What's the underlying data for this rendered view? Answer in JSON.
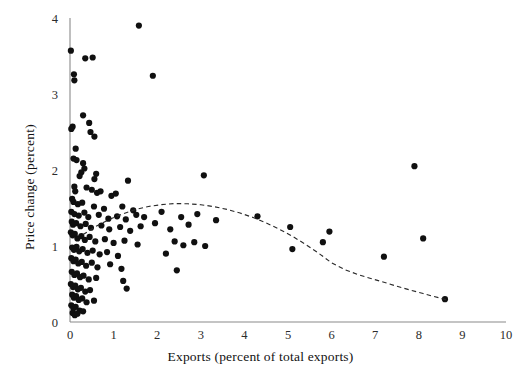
{
  "chart_data": {
    "type": "scatter",
    "title": "",
    "xlabel": "Exports (percent of total exports)",
    "ylabel": "Price change (percent)",
    "xlim": [
      0,
      10
    ],
    "ylim": [
      0,
      4
    ],
    "xticks": [
      0,
      1,
      2,
      3,
      4,
      5,
      6,
      7,
      8,
      9,
      10
    ],
    "yticks": [
      0,
      1,
      2,
      3,
      4
    ],
    "xtick_labels": [
      "0",
      "1",
      "2",
      "3",
      "4",
      "5",
      "6",
      "7",
      "8",
      "9",
      "10"
    ],
    "ytick_labels": [
      "0",
      "1",
      "2",
      "3",
      "4"
    ],
    "grid": false,
    "legend": false,
    "marker_color": "#101010",
    "marker_size": 3.1,
    "series": [
      {
        "name": "observations",
        "points": [
          [
            0.02,
            3.57
          ],
          [
            0.35,
            3.47
          ],
          [
            0.52,
            3.48
          ],
          [
            1.58,
            3.9
          ],
          [
            0.09,
            3.26
          ],
          [
            0.1,
            3.18
          ],
          [
            1.9,
            3.24
          ],
          [
            0.3,
            2.72
          ],
          [
            0.06,
            2.57
          ],
          [
            0.03,
            2.54
          ],
          [
            0.44,
            2.62
          ],
          [
            0.47,
            2.5
          ],
          [
            0.56,
            2.44
          ],
          [
            0.13,
            2.28
          ],
          [
            0.08,
            2.15
          ],
          [
            0.15,
            2.13
          ],
          [
            0.3,
            2.09
          ],
          [
            0.33,
            2.02
          ],
          [
            0.26,
            1.97
          ],
          [
            0.22,
            1.92
          ],
          [
            0.6,
            1.95
          ],
          [
            0.56,
            1.88
          ],
          [
            1.33,
            1.86
          ],
          [
            3.07,
            1.93
          ],
          [
            7.9,
            2.05
          ],
          [
            0.1,
            1.78
          ],
          [
            0.12,
            1.72
          ],
          [
            0.38,
            1.77
          ],
          [
            0.5,
            1.74
          ],
          [
            0.62,
            1.7
          ],
          [
            0.7,
            1.72
          ],
          [
            0.95,
            1.66
          ],
          [
            1.05,
            1.69
          ],
          [
            0.05,
            1.62
          ],
          [
            0.08,
            1.58
          ],
          [
            0.18,
            1.55
          ],
          [
            0.28,
            1.57
          ],
          [
            0.55,
            1.52
          ],
          [
            0.78,
            1.49
          ],
          [
            1.2,
            1.52
          ],
          [
            1.45,
            1.47
          ],
          [
            0.03,
            1.45
          ],
          [
            0.1,
            1.42
          ],
          [
            0.2,
            1.4
          ],
          [
            0.33,
            1.44
          ],
          [
            0.42,
            1.38
          ],
          [
            0.66,
            1.41
          ],
          [
            0.88,
            1.36
          ],
          [
            1.08,
            1.39
          ],
          [
            1.28,
            1.35
          ],
          [
            1.52,
            1.41
          ],
          [
            1.7,
            1.38
          ],
          [
            2.1,
            1.45
          ],
          [
            2.55,
            1.38
          ],
          [
            2.92,
            1.42
          ],
          [
            3.35,
            1.34
          ],
          [
            4.3,
            1.39
          ],
          [
            0.04,
            1.32
          ],
          [
            0.07,
            1.28
          ],
          [
            0.14,
            1.3
          ],
          [
            0.24,
            1.26
          ],
          [
            0.36,
            1.29
          ],
          [
            0.48,
            1.24
          ],
          [
            0.72,
            1.27
          ],
          [
            0.9,
            1.22
          ],
          [
            1.15,
            1.25
          ],
          [
            1.38,
            1.2
          ],
          [
            1.62,
            1.26
          ],
          [
            1.95,
            1.3
          ],
          [
            2.3,
            1.22
          ],
          [
            2.72,
            1.28
          ],
          [
            5.05,
            1.25
          ],
          [
            5.95,
            1.19
          ],
          [
            8.1,
            1.1
          ],
          [
            0.02,
            1.18
          ],
          [
            0.06,
            1.14
          ],
          [
            0.11,
            1.16
          ],
          [
            0.17,
            1.1
          ],
          [
            0.26,
            1.13
          ],
          [
            0.34,
            1.08
          ],
          [
            0.45,
            1.12
          ],
          [
            0.58,
            1.06
          ],
          [
            0.8,
            1.09
          ],
          [
            1.0,
            1.04
          ],
          [
            1.25,
            1.07
          ],
          [
            1.55,
            1.02
          ],
          [
            2.4,
            1.06
          ],
          [
            2.6,
            1.01
          ],
          [
            2.85,
            1.05
          ],
          [
            3.1,
            1.0
          ],
          [
            5.1,
            0.96
          ],
          [
            5.8,
            1.05
          ],
          [
            0.05,
            0.98
          ],
          [
            0.09,
            0.95
          ],
          [
            0.15,
            0.99
          ],
          [
            0.21,
            0.93
          ],
          [
            0.29,
            0.96
          ],
          [
            0.4,
            0.91
          ],
          [
            0.52,
            0.94
          ],
          [
            0.68,
            0.89
          ],
          [
            0.85,
            0.92
          ],
          [
            1.1,
            0.87
          ],
          [
            2.2,
            0.9
          ],
          [
            7.2,
            0.86
          ],
          [
            0.03,
            0.84
          ],
          [
            0.08,
            0.8
          ],
          [
            0.13,
            0.82
          ],
          [
            0.19,
            0.77
          ],
          [
            0.27,
            0.79
          ],
          [
            0.37,
            0.74
          ],
          [
            0.5,
            0.78
          ],
          [
            0.63,
            0.72
          ],
          [
            0.92,
            0.76
          ],
          [
            1.18,
            0.7
          ],
          [
            2.45,
            0.68
          ],
          [
            0.04,
            0.66
          ],
          [
            0.1,
            0.62
          ],
          [
            0.16,
            0.64
          ],
          [
            0.23,
            0.59
          ],
          [
            0.31,
            0.61
          ],
          [
            0.43,
            0.56
          ],
          [
            0.6,
            0.58
          ],
          [
            1.22,
            0.54
          ],
          [
            0.02,
            0.5
          ],
          [
            0.07,
            0.46
          ],
          [
            0.12,
            0.48
          ],
          [
            0.18,
            0.43
          ],
          [
            0.25,
            0.45
          ],
          [
            0.35,
            0.4
          ],
          [
            0.46,
            0.42
          ],
          [
            1.3,
            0.44
          ],
          [
            0.05,
            0.36
          ],
          [
            0.09,
            0.32
          ],
          [
            0.14,
            0.34
          ],
          [
            0.2,
            0.29
          ],
          [
            0.28,
            0.31
          ],
          [
            0.38,
            0.26
          ],
          [
            0.55,
            0.28
          ],
          [
            0.03,
            0.22
          ],
          [
            0.08,
            0.18
          ],
          [
            0.13,
            0.2
          ],
          [
            0.22,
            0.15
          ],
          [
            0.06,
            0.12
          ],
          [
            0.11,
            0.09
          ],
          [
            0.17,
            0.11
          ],
          [
            0.3,
            0.14
          ],
          [
            8.6,
            0.3
          ]
        ]
      }
    ],
    "fit_curve": {
      "name": "quadratic fit",
      "style": "dashed",
      "color": "#2a2a2a",
      "x_start": 0.3,
      "x_end": 8.62,
      "vertex_x": 2.55,
      "vertex_y": 1.56,
      "points": [
        [
          0.3,
          1.15
        ],
        [
          0.6,
          1.26
        ],
        [
          0.9,
          1.35
        ],
        [
          1.2,
          1.42
        ],
        [
          1.5,
          1.48
        ],
        [
          1.8,
          1.52
        ],
        [
          2.1,
          1.545
        ],
        [
          2.4,
          1.558
        ],
        [
          2.7,
          1.556
        ],
        [
          3.0,
          1.543
        ],
        [
          3.3,
          1.518
        ],
        [
          3.6,
          1.482
        ],
        [
          3.9,
          1.434
        ],
        [
          4.2,
          1.375
        ],
        [
          4.5,
          1.304
        ],
        [
          4.8,
          1.222
        ],
        [
          5.1,
          1.128
        ],
        [
          5.4,
          1.023
        ],
        [
          5.7,
          0.906
        ],
        [
          6.0,
          0.778
        ],
        [
          6.3,
          0.69
        ],
        [
          6.6,
          0.625
        ],
        [
          6.9,
          0.572
        ],
        [
          7.2,
          0.523
        ],
        [
          7.5,
          0.47
        ],
        [
          7.8,
          0.42
        ],
        [
          8.1,
          0.375
        ],
        [
          8.35,
          0.335
        ],
        [
          8.62,
          0.295
        ]
      ]
    }
  },
  "axes": {
    "x_title": "Exports (percent of total exports)",
    "y_title": "Price change (percent)"
  }
}
